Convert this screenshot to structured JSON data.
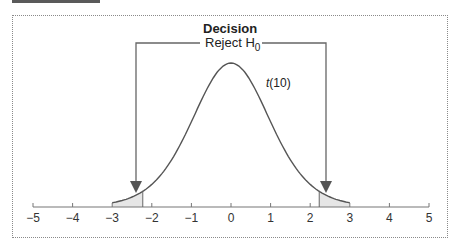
{
  "diagram": {
    "title": "Decision",
    "subtitle_prefix": "Reject H",
    "subtitle_subscript": "0",
    "distribution_prefix": "t",
    "distribution_suffix": "(10)",
    "critical_values": [
      -2.228,
      2.228
    ],
    "curve_range": [
      -3,
      3
    ],
    "colors": {
      "line": "#555555",
      "shade": "#e6e6e6",
      "arrow": "#555555",
      "text": "#222222"
    }
  },
  "axis": {
    "ticks": [
      "−5",
      "−4",
      "−3",
      "−2",
      "−1",
      "0",
      "1",
      "2",
      "3",
      "4",
      "5"
    ],
    "min": -5,
    "max": 5
  }
}
